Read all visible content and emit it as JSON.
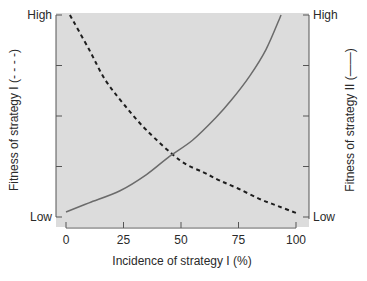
{
  "chart_data": {
    "type": "line",
    "title": "",
    "xlabel": "Incidence of strategy I (%)",
    "ylabel_left": "Fitness of strategy I (- - - -)",
    "ylabel_right": "Fitness of strategy II (——)",
    "xlim": [
      0,
      100
    ],
    "ylim": [
      0,
      1
    ],
    "x_ticks": [
      0,
      25,
      50,
      75,
      100
    ],
    "x_tick_labels": [
      "0",
      "25",
      "50",
      "75",
      "100"
    ],
    "y_ticks": [
      0,
      0.25,
      0.5,
      0.75,
      1
    ],
    "y_left_tick_labels": {
      "0": "Low",
      "1": "High"
    },
    "y_right_tick_labels": {
      "0": "Low",
      "1": "High"
    },
    "grid": false,
    "legend": "none",
    "series": [
      {
        "name": "Fitness of strategy I",
        "style": "dashed",
        "color": "#1e1e1e",
        "x": [
          1.7,
          10,
          17,
          25,
          35,
          49.6,
          60,
          67,
          75,
          84,
          92,
          100
        ],
        "y": [
          1.0,
          0.83,
          0.68,
          0.56,
          0.43,
          0.28,
          0.22,
          0.18,
          0.14,
          0.09,
          0.055,
          0.02
        ]
      },
      {
        "name": "Fitness of strategy II",
        "style": "solid",
        "color": "#6b6b6b",
        "x": [
          0,
          10,
          23.5,
          35,
          45,
          55,
          65,
          72,
          80,
          87,
          93.5
        ],
        "y": [
          0.025,
          0.07,
          0.13,
          0.21,
          0.3,
          0.38,
          0.49,
          0.58,
          0.7,
          0.83,
          1.0
        ]
      }
    ],
    "plot_background": "#dcdcdc"
  }
}
